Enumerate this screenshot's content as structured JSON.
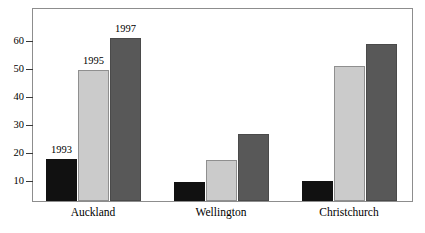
{
  "chart_data": {
    "type": "bar",
    "title": "",
    "subtitle": "",
    "xlabel": "",
    "ylabel": "",
    "categories": [
      "Auckland",
      "Wellington",
      "Christchurch"
    ],
    "series": [
      {
        "name": "1993",
        "values": [
          14.5,
          6.5,
          7.0
        ],
        "color": "#111111"
      },
      {
        "name": "1995",
        "values": [
          45.0,
          14.0,
          46.5
        ],
        "color": "#cbcbcb"
      },
      {
        "name": "1997",
        "values": [
          56.0,
          23.0,
          54.0
        ],
        "color": "#585858"
      }
    ],
    "ylim": [
      0,
      66
    ],
    "yticks": [
      10,
      20,
      30,
      40,
      50,
      60
    ],
    "ytick_labels": [
      "10",
      "20",
      "30",
      "40",
      "50",
      "60"
    ],
    "grid": false,
    "legend": "none",
    "annotations": [
      {
        "text": "1993",
        "series": "1993",
        "category": "Auckland"
      },
      {
        "text": "1995",
        "series": "1995",
        "category": "Auckland"
      },
      {
        "text": "1997",
        "series": "1997",
        "category": "Auckland"
      }
    ]
  },
  "axis": {
    "ytick_0": "10",
    "ytick_1": "20",
    "ytick_2": "30",
    "ytick_3": "40",
    "ytick_4": "50",
    "ytick_5": "60"
  },
  "bar_labels": {
    "label_1993": "1993",
    "label_1995": "1995",
    "label_1997": "1997"
  },
  "x_labels": {
    "auckland": "Auckland",
    "wellington": "Wellington",
    "christchurch": "Christchurch"
  }
}
